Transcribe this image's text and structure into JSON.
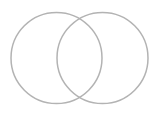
{
  "diagram": {
    "type": "venn",
    "stroke_color": "#b3b3b3",
    "stroke_width": 1.5,
    "fill": "none",
    "circles": [
      {
        "name": "left-circle",
        "cx": 56.5,
        "cy": 58,
        "r": 45.5
      },
      {
        "name": "right-circle",
        "cx": 102.5,
        "cy": 58,
        "r": 45.5
      }
    ]
  }
}
